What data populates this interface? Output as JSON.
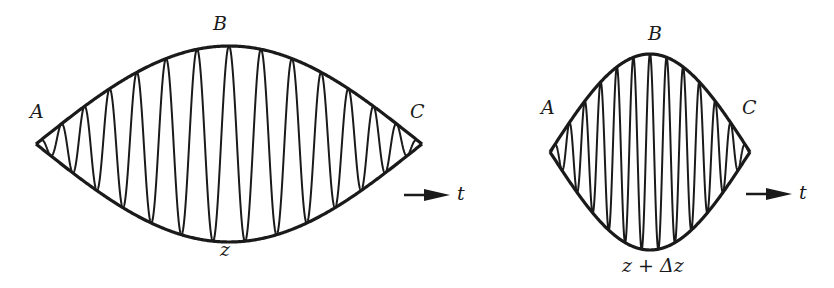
{
  "figure": {
    "left_pulse": {
      "labels": {
        "a": "A",
        "b": "B",
        "c": "C",
        "position": "z"
      },
      "bounds": {
        "x0": 36,
        "x1": 422,
        "cy": 144,
        "half_height": 98
      },
      "carrier_cycles": 12
    },
    "right_pulse": {
      "labels": {
        "a": "A",
        "b": "B",
        "c": "C",
        "position": "z + Δz"
      },
      "bounds": {
        "x0": 550,
        "x1": 750,
        "cy": 152,
        "half_height": 98
      },
      "carrier_cycles": 12
    },
    "time_axis_label": "t",
    "stroke_color": "#1a1a1a"
  }
}
